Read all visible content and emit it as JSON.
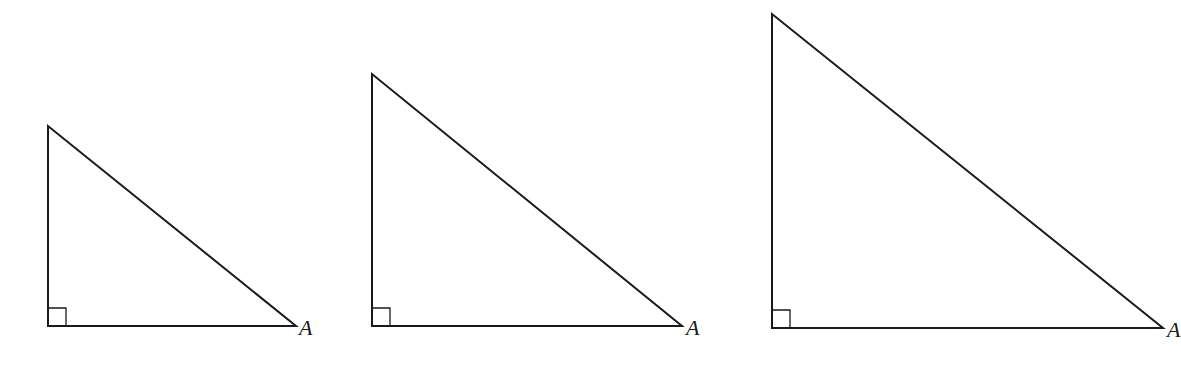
{
  "diagram": {
    "stroke_color": "#1a1a1a",
    "background": "#ffffff",
    "triangles": [
      {
        "id": "small",
        "vertex_label": "A",
        "top": [
          48,
          126
        ],
        "right_angle": [
          48,
          326
        ],
        "a_vertex": [
          296,
          326
        ],
        "label_pos": [
          299,
          335
        ]
      },
      {
        "id": "medium",
        "vertex_label": "A",
        "top": [
          372,
          74
        ],
        "right_angle": [
          372,
          326
        ],
        "a_vertex": [
          682,
          326
        ],
        "label_pos": [
          686,
          335
        ]
      },
      {
        "id": "large",
        "vertex_label": "A",
        "top": [
          772,
          14
        ],
        "right_angle": [
          772,
          328
        ],
        "a_vertex": [
          1163,
          328
        ],
        "label_pos": [
          1167,
          337
        ]
      }
    ]
  }
}
